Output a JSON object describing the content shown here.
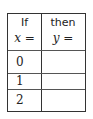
{
  "table": {
    "headers": [
      {
        "line1": "If",
        "var": "x",
        "op": "="
      },
      {
        "line1": "then",
        "var": "y",
        "op": "="
      }
    ],
    "rows": [
      {
        "x": "0",
        "y": ""
      },
      {
        "x": "1",
        "y": ""
      },
      {
        "x": "2",
        "y": ""
      }
    ]
  }
}
